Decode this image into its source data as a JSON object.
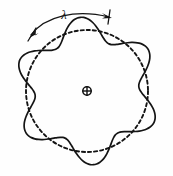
{
  "figure": {
    "domain": "scientific-diagram",
    "background_color": "#fefefe",
    "ink_color": "#141414",
    "width_px": 173,
    "height_px": 176,
    "annotations": {
      "wavelength_label": "λ",
      "center_marker_symbol": "⊕",
      "center_marker_name": "circle-plus-center-marker"
    },
    "legend_items": [
      {
        "name": "solid-wavy-contour",
        "style": "solid",
        "meaning": "perturbed wave contour"
      },
      {
        "name": "dashed-reference-circle",
        "style": "dashed",
        "meaning": "unperturbed circular boundary"
      }
    ]
  },
  "chart_data": {
    "type": "line",
    "subtitle": "",
    "xlabel": "",
    "ylabel": "",
    "grid": false,
    "legend_position": "none",
    "coordinate_system": "polar",
    "center": {
      "x": 87,
      "y": 91
    },
    "annotations": [
      {
        "name": "wavelength-span-arc",
        "text": "λ",
        "label_x": 64,
        "label_y": 14,
        "arc_start": {
          "x": 30,
          "y": 36
        },
        "arc_end": {
          "x": 110,
          "y": 17
        },
        "arrowheads": "both",
        "spans": "one full wavelength along the contour"
      }
    ],
    "series": [
      {
        "name": "dashed-reference-circle",
        "style": "dashed",
        "type": "polar-constant",
        "mean_radius": 61,
        "amplitude": 0,
        "lobes": 0,
        "center_offset": {
          "x": 0,
          "y": 0
        },
        "sample_points_theta_deg": [
          0,
          30,
          60,
          90,
          120,
          150,
          180,
          210,
          240,
          270,
          300,
          330
        ],
        "sample_points_r": [
          61,
          61,
          61,
          61,
          61,
          61,
          61,
          61,
          61,
          61,
          61,
          61
        ]
      },
      {
        "name": "solid-wavy-contour",
        "style": "solid",
        "type": "polar-sinusoid",
        "mean_radius": 63,
        "amplitude": 11,
        "lobes": 6,
        "phase_deg": 30,
        "center_offset": {
          "x": 0,
          "y": 0
        },
        "sample_points_theta_deg": [
          0,
          15,
          30,
          45,
          60,
          75,
          90,
          105,
          120,
          135,
          150,
          165,
          180,
          195,
          210,
          225,
          240,
          255,
          270,
          285,
          300,
          315,
          330,
          345
        ],
        "sample_points_r": [
          52,
          59,
          74,
          59,
          52,
          59,
          74,
          59,
          52,
          59,
          74,
          59,
          52,
          59,
          74,
          59,
          52,
          59,
          74,
          59,
          52,
          59,
          74,
          59
        ]
      }
    ],
    "xlim": [
      0,
      173
    ],
    "ylim": [
      0,
      176
    ]
  }
}
